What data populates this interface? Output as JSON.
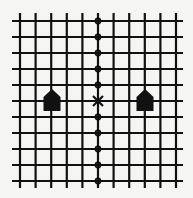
{
  "diagram": {
    "background": "#f5f5f3",
    "line_color": "#111111",
    "line_width": 2.2,
    "grid": {
      "columns": 11,
      "rows": 11,
      "x_start": 20,
      "x_end": 176,
      "y_start": 21,
      "y_end": 181,
      "line_x_min": 12,
      "line_x_max": 183,
      "line_y_min": 13,
      "line_y_max": 188
    },
    "center_marker": {
      "icon": "x-mark-icon",
      "column": 5,
      "row": 5,
      "size": 5
    },
    "path_markers": {
      "icon": "circle-icon",
      "column": 5,
      "rows": [
        0,
        1,
        2,
        3,
        4,
        6,
        7,
        8,
        9,
        10
      ],
      "radius": 2.6
    },
    "houses": [
      {
        "icon": "house-icon",
        "label": "house-left",
        "center_x": 52,
        "tip_y": 89,
        "shoulder_y": 97,
        "bottom_y": 111,
        "half_width": 8.5
      },
      {
        "icon": "house-icon",
        "label": "house-right",
        "center_x": 145,
        "tip_y": 89,
        "shoulder_y": 97,
        "bottom_y": 111,
        "half_width": 8.5
      }
    ]
  }
}
